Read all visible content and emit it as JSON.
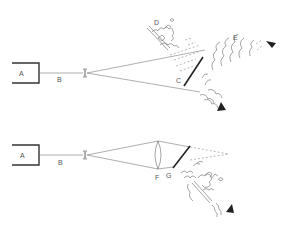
{
  "diagram": {
    "top": {
      "labels": {
        "source": "A",
        "beam": "B",
        "mirror": "C",
        "scene": "D",
        "image": "E"
      }
    },
    "bottom": {
      "labels": {
        "source": "A",
        "beam": "B",
        "lens": "F",
        "mirror": "G"
      }
    },
    "colors": {
      "ink": "#333333",
      "line": "#777777",
      "background": "#ffffff"
    }
  }
}
